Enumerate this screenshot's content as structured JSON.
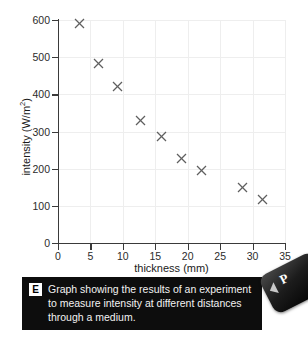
{
  "chart_data": {
    "type": "scatter",
    "title": "",
    "xlabel": "thickness (mm)",
    "ylabel": "intensity (W/m²)",
    "ylabel_base": "intensity (W/m",
    "ylabel_sup": "2",
    "ylabel_close": ")",
    "xlim": [
      0,
      35
    ],
    "ylim": [
      0,
      600
    ],
    "xticks": [
      0,
      5,
      10,
      15,
      20,
      25,
      30,
      35
    ],
    "yticks": [
      0,
      100,
      200,
      300,
      400,
      500,
      600
    ],
    "grid": true,
    "legend": "none",
    "marker": "x-cross",
    "marker_color": "#5f5f5f",
    "points": [
      {
        "x": 3.3,
        "y": 590
      },
      {
        "x": 6.2,
        "y": 482
      },
      {
        "x": 9.2,
        "y": 422
      },
      {
        "x": 12.7,
        "y": 330
      },
      {
        "x": 16.0,
        "y": 286
      },
      {
        "x": 19.1,
        "y": 228
      },
      {
        "x": 22.1,
        "y": 194
      },
      {
        "x": 28.4,
        "y": 148
      },
      {
        "x": 31.6,
        "y": 118
      }
    ]
  },
  "caption": {
    "badge": "E",
    "text": "Graph showing the results of an experiment to measure intensity at different distances through a medium."
  },
  "corner_tab": {
    "letter": "P"
  },
  "colors": {
    "axis": "#3a3a3a",
    "grid": "#eeeeee",
    "marker": "#5f5f5f",
    "caption_bg": "#0d0d0d",
    "caption_text": "#f2f2f2",
    "badge_bg": "#ffffff",
    "badge_text": "#000000"
  }
}
